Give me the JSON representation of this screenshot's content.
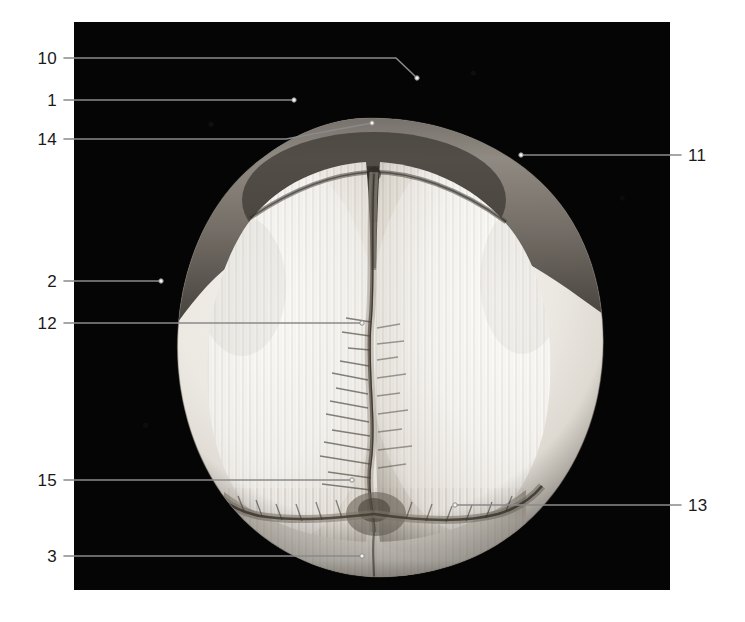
{
  "figure": {
    "background_color": "#ffffff",
    "plate_color": "#050505",
    "leader_color": "#8a8a8a",
    "label_color": "#1a1a1a",
    "plate": {
      "x": 74,
      "y": 22,
      "width": 596,
      "height": 568
    }
  },
  "labels": [
    {
      "id": "10",
      "text": "10",
      "side": "left",
      "text_x": 57,
      "text_y": 58,
      "line": [
        [
          64,
          58
        ],
        [
          396,
          58
        ],
        [
          417,
          78
        ]
      ],
      "dot": [
        417,
        78
      ]
    },
    {
      "id": "1",
      "text": "1",
      "side": "left",
      "text_x": 57,
      "text_y": 100,
      "line": [
        [
          64,
          100
        ],
        [
          294,
          100
        ]
      ],
      "dot": [
        294,
        100
      ]
    },
    {
      "id": "14",
      "text": "14",
      "side": "left",
      "text_x": 57,
      "text_y": 139,
      "line": [
        [
          64,
          139
        ],
        [
          286,
          139
        ],
        [
          372,
          123
        ]
      ],
      "dot": [
        372,
        123
      ]
    },
    {
      "id": "2",
      "text": "2",
      "side": "left",
      "text_x": 57,
      "text_y": 281,
      "line": [
        [
          64,
          281
        ],
        [
          161,
          281
        ]
      ],
      "dot": [
        161,
        281
      ]
    },
    {
      "id": "12",
      "text": "12",
      "side": "left",
      "text_x": 57,
      "text_y": 323,
      "line": [
        [
          64,
          323
        ],
        [
          362,
          323
        ]
      ],
      "dot": [
        362,
        323
      ]
    },
    {
      "id": "15",
      "text": "15",
      "side": "left",
      "text_x": 57,
      "text_y": 480,
      "line": [
        [
          64,
          480
        ],
        [
          352,
          480
        ]
      ],
      "dot": [
        352,
        480
      ]
    },
    {
      "id": "3",
      "text": "3",
      "side": "left",
      "text_x": 57,
      "text_y": 556,
      "line": [
        [
          64,
          556
        ],
        [
          362,
          556
        ]
      ],
      "dot": [
        362,
        556
      ]
    },
    {
      "id": "11",
      "text": "11",
      "side": "right",
      "text_x": 688,
      "text_y": 155,
      "line": [
        [
          681,
          155
        ],
        [
          521,
          155
        ]
      ],
      "dot": [
        521,
        155
      ]
    },
    {
      "id": "13",
      "text": "13",
      "side": "right",
      "text_x": 688,
      "text_y": 505,
      "line": [
        [
          681,
          505
        ],
        [
          455,
          505
        ]
      ],
      "dot": [
        455,
        505
      ]
    }
  ]
}
